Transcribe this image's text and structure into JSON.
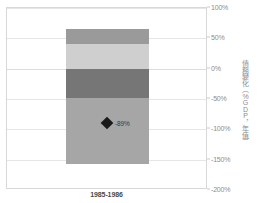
{
  "chart_data": {
    "type": "bar",
    "title": "",
    "subtitle": "",
    "xlabel": "",
    "ylabel": "債務變化（%GDP，年值）",
    "categories": [
      "1985-1986"
    ],
    "ylim": [
      -200,
      100
    ],
    "yticks": [
      100,
      50,
      0,
      -50,
      -100,
      -150,
      -200
    ],
    "ytick_labels": [
      "100%",
      "50%",
      "0%",
      "-50%",
      "-100%",
      "-150%",
      "-200%"
    ],
    "grid": true,
    "legend": "none",
    "stacked": true,
    "series": [
      {
        "name": "segment-1",
        "values": [
          25
        ],
        "range": [
          40,
          65
        ],
        "color": "#9a9a9a"
      },
      {
        "name": "segment-2",
        "values": [
          40
        ],
        "range": [
          0,
          40
        ],
        "color": "#cfcfcf"
      },
      {
        "name": "segment-3",
        "values": [
          -48
        ],
        "range": [
          -48,
          0
        ],
        "color": "#767676"
      },
      {
        "name": "segment-4",
        "values": [
          -110
        ],
        "range": [
          -158,
          -48
        ],
        "color": "#a6a6a6"
      }
    ],
    "annotations": [
      {
        "name": "net-change-marker",
        "category": "1985-1986",
        "value": -89,
        "label": "-89%",
        "marker": "diamond",
        "color": "#1a1a1a"
      }
    ]
  },
  "axis": {
    "y_title": "債務變化（%GDP，年值）",
    "ticks": [
      {
        "label": "100%",
        "value": 100
      },
      {
        "label": "50%",
        "value": 50
      },
      {
        "label": "0%",
        "value": 0
      },
      {
        "label": "-50%",
        "value": -50
      },
      {
        "label": "-100%",
        "value": -100
      },
      {
        "label": "-150%",
        "value": -150
      },
      {
        "label": "-200%",
        "value": -200
      }
    ]
  },
  "category": {
    "label": "1985-1986"
  },
  "marker": {
    "label": "-89%"
  },
  "colors": {
    "segment_1": "#9a9a9a",
    "segment_2": "#cfcfcf",
    "segment_3": "#767676",
    "segment_4": "#a6a6a6",
    "marker": "#1a1a1a",
    "grid": "#e6e6e6",
    "frame": "#d8d8d8",
    "tick_text": "#8c8c8c",
    "category_text": "#4a4a4a"
  }
}
